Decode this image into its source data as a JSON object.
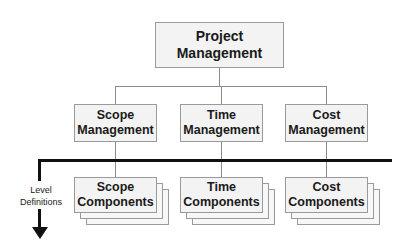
{
  "diagram": {
    "root": {
      "line1": "Project",
      "line2": "Management"
    },
    "areas": [
      {
        "line1": "Scope",
        "line2": "Management"
      },
      {
        "line1": "Time",
        "line2": "Management"
      },
      {
        "line1": "Cost",
        "line2": "Management"
      }
    ],
    "components": [
      {
        "line1": "Scope",
        "line2": "Components"
      },
      {
        "line1": "Time",
        "line2": "Components"
      },
      {
        "line1": "Cost",
        "line2": "Components"
      }
    ],
    "level_label": {
      "line1": "Level",
      "line2": "Definitions"
    }
  }
}
